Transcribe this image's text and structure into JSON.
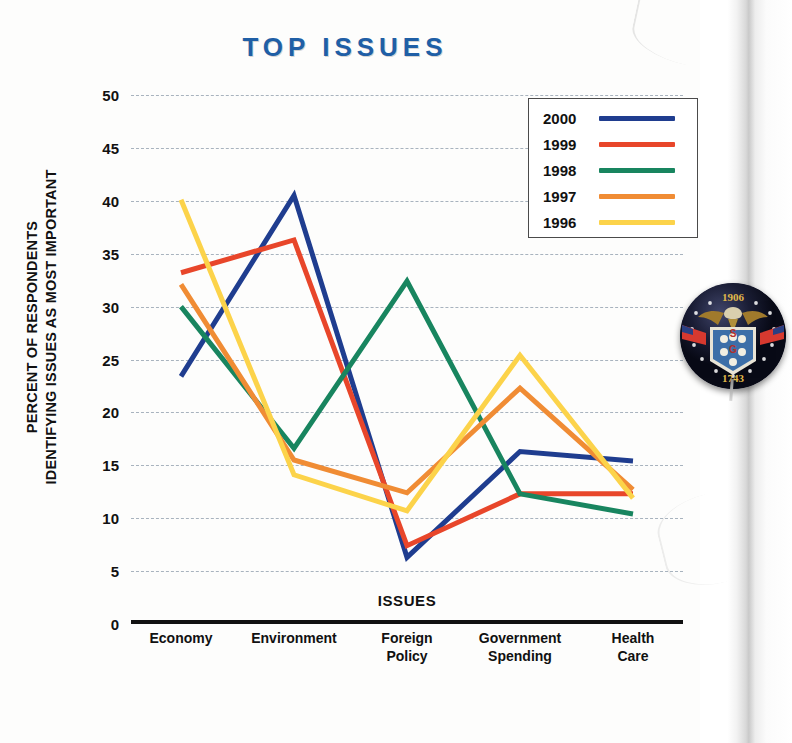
{
  "chart_data": {
    "type": "line",
    "title": "TOP ISSUES",
    "xlabel": "ISSUES",
    "ylabel": "PERCENT OF RESPONDENTS\nIDENTIFYING ISSUES AS MOST IMPORTANT",
    "categories": [
      "Economy",
      "Environment",
      "Foreign\nPolicy",
      "Government\nSpending",
      "Health\nCare"
    ],
    "ylim": [
      0,
      50
    ],
    "yticks": [
      0,
      5,
      10,
      15,
      20,
      25,
      30,
      35,
      40,
      45,
      50
    ],
    "grid": true,
    "legend_position": "top-right",
    "series": [
      {
        "name": "2000",
        "color": "#1f3d8f",
        "values": [
          23.4,
          40.5,
          6.3,
          16.3,
          15.4
        ]
      },
      {
        "name": "1999",
        "color": "#e8462a",
        "values": [
          33.2,
          36.3,
          7.4,
          12.3,
          12.3
        ]
      },
      {
        "name": "1998",
        "color": "#18855f",
        "values": [
          30.0,
          16.6,
          32.4,
          12.3,
          10.4
        ]
      },
      {
        "name": "1997",
        "color": "#f08c34",
        "values": [
          32.1,
          15.5,
          12.4,
          22.3,
          12.7
        ]
      },
      {
        "name": "1996",
        "color": "#fcd34a",
        "values": [
          40.1,
          14.1,
          10.7,
          25.4,
          11.9
        ]
      }
    ]
  },
  "decor": {
    "badge_name": "campaign-button",
    "badge_top_year": "1906",
    "badge_bottom_year": "1743"
  }
}
